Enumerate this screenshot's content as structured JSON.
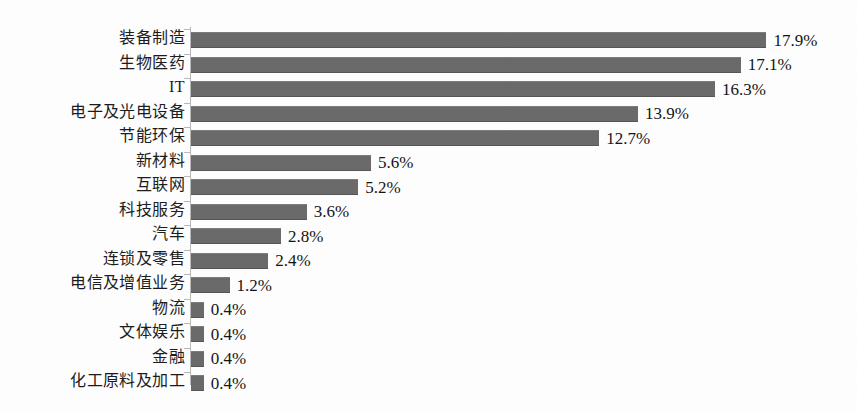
{
  "chart_data": {
    "type": "bar",
    "orientation": "horizontal",
    "title": "",
    "subtitle": "",
    "xlabel": "",
    "ylabel": "",
    "grid": false,
    "legend": false,
    "legend_position": "none",
    "xlim": [
      0,
      18
    ],
    "value_suffix": "%",
    "bar_color": "#6a6a6a",
    "axis_color": "#b9b9b9",
    "background_color": "#ffffff",
    "text_color": "#1c1c1c",
    "categories": [
      "装备制造",
      "生物医药",
      "IT",
      "电子及光电设备",
      "节能环保",
      "新材料",
      "互联网",
      "科技服务",
      "汽车",
      "连锁及零售",
      "电信及增值业务",
      "物流",
      "文体娱乐",
      "金融",
      "化工原料及加工"
    ],
    "values": [
      17.9,
      17.1,
      16.3,
      13.9,
      12.7,
      5.6,
      5.2,
      3.6,
      2.8,
      2.4,
      1.2,
      0.4,
      0.4,
      0.4,
      0.4
    ],
    "value_labels": [
      "17.9%",
      "17.1%",
      "16.3%",
      "13.9%",
      "12.7%",
      "5.6%",
      "5.2%",
      "3.6%",
      "2.8%",
      "2.4%",
      "1.2%",
      "0.4%",
      "0.4%",
      "0.4%",
      "0.4%"
    ]
  }
}
